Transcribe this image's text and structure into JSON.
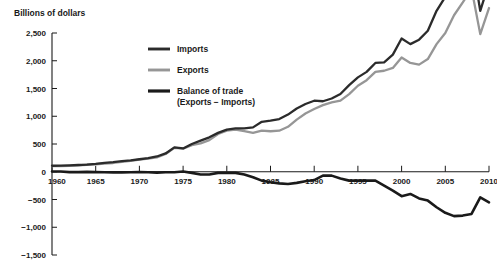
{
  "chart_data": {
    "type": "line",
    "title": "",
    "ylabel": "Billions of dollars",
    "xlabel": "",
    "grid": false,
    "legend_position": "inside-top-left",
    "x": [
      1960,
      1961,
      1962,
      1963,
      1964,
      1965,
      1966,
      1967,
      1968,
      1969,
      1970,
      1971,
      1972,
      1973,
      1974,
      1975,
      1976,
      1977,
      1978,
      1979,
      1980,
      1981,
      1982,
      1983,
      1984,
      1985,
      1986,
      1987,
      1988,
      1989,
      1990,
      1991,
      1992,
      1993,
      1994,
      1995,
      1996,
      1997,
      1998,
      1999,
      2000,
      2001,
      2002,
      2003,
      2004,
      2005,
      2006,
      2007,
      2008,
      2009,
      2010
    ],
    "xlim": [
      1960,
      2010
    ],
    "ylim": [
      -1500,
      2500
    ],
    "xticks": [
      1960,
      1965,
      1970,
      1975,
      1980,
      1985,
      1990,
      1995,
      2000,
      2005,
      2010
    ],
    "xtick_labels": [
      "1960",
      "1965",
      "1970",
      "1975",
      "1980",
      "1985",
      "1990",
      "1995",
      "2000",
      "2005",
      "2010"
    ],
    "yticks": [
      2500,
      2000,
      1500,
      1000,
      500,
      0,
      -500,
      -1000,
      -1500
    ],
    "ytick_labels": [
      "2,500",
      "2,000",
      "1,500",
      "1,000",
      "500",
      "0",
      "−500",
      "−1,000",
      "−1,500"
    ],
    "series": [
      {
        "name": "Imports",
        "color": "#2b2b2b",
        "width": 2.3,
        "values": [
          108,
          110,
          116,
          122,
          130,
          142,
          160,
          172,
          190,
          205,
          225,
          245,
          275,
          330,
          440,
          420,
          500,
          560,
          620,
          700,
          760,
          780,
          780,
          800,
          900,
          920,
          950,
          1030,
          1140,
          1220,
          1280,
          1270,
          1320,
          1400,
          1560,
          1700,
          1800,
          1960,
          1970,
          2110,
          2400,
          2300,
          2380,
          2540,
          2900,
          3150,
          3420,
          3550,
          3850,
          2900,
          3400
        ]
      },
      {
        "name": "Exports",
        "color": "#969696",
        "width": 2.3,
        "values": [
          100,
          102,
          107,
          114,
          126,
          135,
          148,
          158,
          178,
          195,
          220,
          235,
          260,
          320,
          430,
          415,
          480,
          510,
          570,
          680,
          740,
          760,
          730,
          700,
          740,
          730,
          740,
          810,
          940,
          1050,
          1130,
          1200,
          1250,
          1280,
          1400,
          1550,
          1650,
          1800,
          1820,
          1870,
          2060,
          1960,
          1930,
          2030,
          2300,
          2500,
          2820,
          3050,
          3300,
          2480,
          2950
        ]
      },
      {
        "name": "Balance of trade",
        "sublabel": "(Exports − Imports)",
        "color": "#1a1a1a",
        "width": 2.6,
        "values": [
          5,
          5,
          -6,
          -6,
          -3,
          -6,
          -10,
          -12,
          -12,
          -10,
          -5,
          -10,
          -15,
          -10,
          -10,
          5,
          -20,
          -50,
          -50,
          -20,
          -20,
          -20,
          -50,
          -100,
          -160,
          -190,
          -210,
          -220,
          -200,
          -170,
          -150,
          -70,
          -70,
          -120,
          -160,
          -160,
          -160,
          -160,
          -250,
          -340,
          -440,
          -400,
          -480,
          -520,
          -640,
          -740,
          -800,
          -790,
          -760,
          -460,
          -550
        ]
      }
    ],
    "note": "Line chart of U.S. imports, exports and balance of trade, 1960-2010, in billions of dollars. Imports and Exports plotted as multi-decade growth curves peaking near 2008 with a 2009 recession dip; Balance of trade stays near zero until the mid-1970s then declines to a trough near -800 around 2006 before a partial 2009 recovery."
  },
  "legend": {
    "items": [
      {
        "label": "Imports",
        "sublabel": ""
      },
      {
        "label": "Exports",
        "sublabel": ""
      },
      {
        "label": "Balance of trade",
        "sublabel": "(Exports − Imports)"
      }
    ]
  },
  "watermark": {
    "text": ""
  }
}
